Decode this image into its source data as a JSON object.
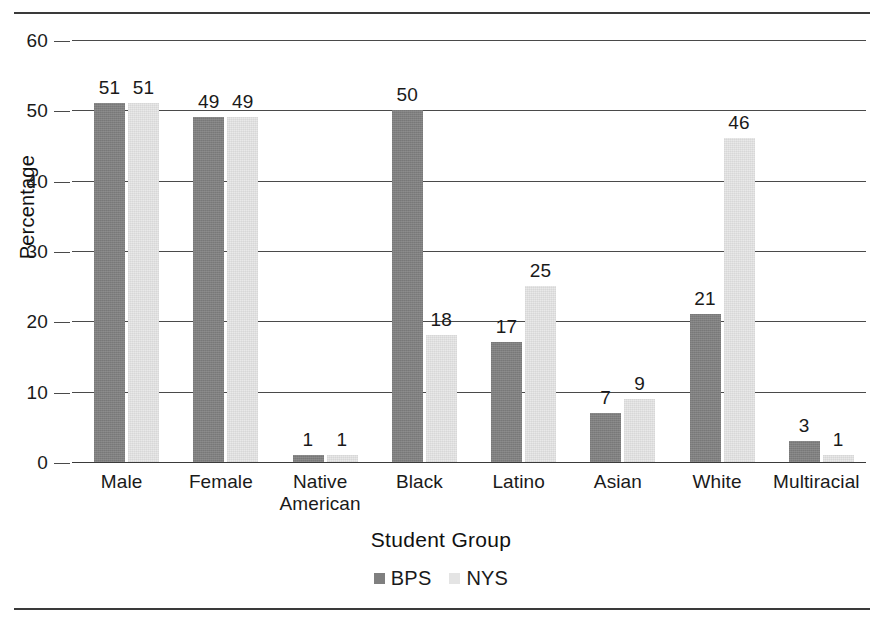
{
  "chart_data": {
    "type": "bar",
    "title": "",
    "xlabel": "Student Group",
    "ylabel": "Percentage",
    "categories": [
      "Male",
      "Female",
      "Native American",
      "Black",
      "Latino",
      "Asian",
      "White",
      "Multiracial"
    ],
    "category_lines": [
      [
        "Male"
      ],
      [
        "Female"
      ],
      [
        "Native",
        "American"
      ],
      [
        "Black"
      ],
      [
        "Latino"
      ],
      [
        "Asian"
      ],
      [
        "White"
      ],
      [
        "Multiracial"
      ]
    ],
    "series": [
      {
        "name": "BPS",
        "color": "#7f7f7f",
        "values": [
          51,
          49,
          1,
          50,
          17,
          7,
          21,
          3
        ]
      },
      {
        "name": "NYS",
        "color": "#e9e9e9",
        "values": [
          51,
          49,
          1,
          18,
          25,
          9,
          46,
          1
        ]
      }
    ],
    "ylim": [
      0,
      60
    ],
    "yticks": [
      0,
      10,
      20,
      30,
      40,
      50,
      60
    ],
    "ytick_labels": [
      "0",
      "10",
      "20",
      "30",
      "40",
      "50",
      "60"
    ],
    "grid": true,
    "grid_axis": "y",
    "legend_position": "bottom-center",
    "data_labels": true,
    "bar_value_labels": [
      [
        "51",
        "51"
      ],
      [
        "49",
        "49"
      ],
      [
        "1",
        "1"
      ],
      [
        "50",
        "18"
      ],
      [
        "17",
        "25"
      ],
      [
        "7",
        "9"
      ],
      [
        "21",
        "46"
      ],
      [
        "3",
        "1"
      ]
    ]
  },
  "legend": {
    "items": [
      {
        "label": "BPS",
        "color": "#7f7f7f"
      },
      {
        "label": "NYS",
        "color": "#e4e4e4"
      }
    ]
  },
  "axes": {
    "y_title": "Percentage",
    "x_title": "Student Group"
  }
}
